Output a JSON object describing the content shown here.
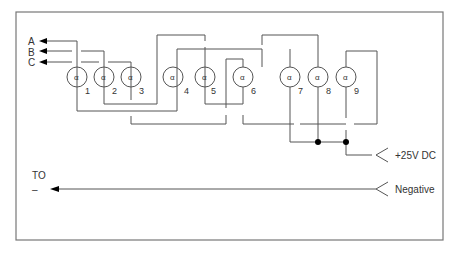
{
  "diagram": {
    "type": "wiring-schematic",
    "colors": {
      "line": "#555555",
      "frame": "#777777",
      "text": "#333333",
      "node": "#000000",
      "background": "#ffffff"
    },
    "outputs": [
      {
        "label": "A"
      },
      {
        "label": "B"
      },
      {
        "label": "C"
      }
    ],
    "lamps": [
      {
        "number": "1",
        "glyph": "α"
      },
      {
        "number": "2",
        "glyph": "α"
      },
      {
        "number": "3",
        "glyph": "α"
      },
      {
        "number": "4",
        "glyph": "α"
      },
      {
        "number": "5",
        "glyph": "α"
      },
      {
        "number": "6",
        "glyph": "α"
      },
      {
        "number": "7",
        "glyph": "α"
      },
      {
        "number": "8",
        "glyph": "α"
      },
      {
        "number": "9",
        "glyph": "α"
      }
    ],
    "supply": {
      "positive_label": "+25V DC",
      "negative_label": "Negative",
      "to_label": "TO",
      "to_symbol": "–"
    }
  }
}
